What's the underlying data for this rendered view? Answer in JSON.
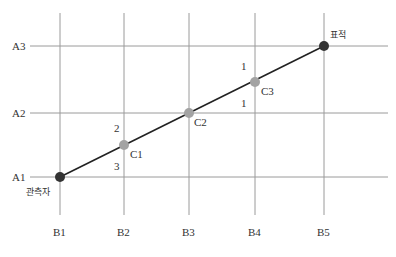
{
  "diagram": {
    "row_labels": [
      "A1",
      "A2",
      "A3"
    ],
    "col_labels": [
      "B1",
      "B2",
      "B3",
      "B4",
      "B5"
    ],
    "points": {
      "observer": {
        "label": "관측자",
        "color": "#333333"
      },
      "c1": {
        "label": "C1",
        "color": "#a0a0a0"
      },
      "c2": {
        "label": "C2",
        "color": "#a0a0a0"
      },
      "c3": {
        "label": "C3",
        "color": "#a0a0a0"
      },
      "target": {
        "label": "표적",
        "color": "#333333"
      }
    },
    "segment_numbers": {
      "c1_above": "2",
      "c1_below": "3",
      "c3_above": "1",
      "c3_below": "1"
    },
    "colors": {
      "grid": "#999999",
      "line": "#222222"
    }
  }
}
